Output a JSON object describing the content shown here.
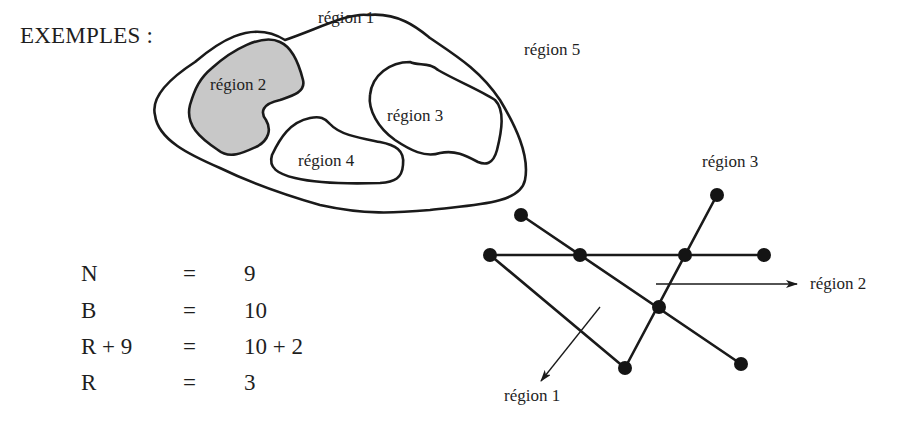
{
  "heading": "EXEMPLES :",
  "colors": {
    "stroke": "#1a1a1a",
    "shaded_region": "#c8c8c8",
    "background": "#ffffff"
  },
  "map_diagram": {
    "regions": [
      {
        "id": "region-1",
        "label": "région 1",
        "shaded": false
      },
      {
        "id": "region-2",
        "label": "région 2",
        "shaded": true
      },
      {
        "id": "region-3",
        "label": "région 3",
        "shaded": false
      },
      {
        "id": "region-4",
        "label": "région 4",
        "shaded": false
      },
      {
        "id": "region-5",
        "label": "région 5",
        "shaded": false
      }
    ]
  },
  "equations": {
    "rows": [
      {
        "lhs": "N",
        "op": "=",
        "rhs": "9"
      },
      {
        "lhs": "B",
        "op": "=",
        "rhs": "10"
      },
      {
        "lhs": "R + 9",
        "op": "=",
        "rhs": "10 + 2"
      },
      {
        "lhs": "R",
        "op": "=",
        "rhs": "3"
      }
    ]
  },
  "graph_diagram": {
    "node_count": 9,
    "edge_count": 10,
    "labels": {
      "region_1": "région 1",
      "region_2": "région 2",
      "region_3": "région 3"
    }
  }
}
